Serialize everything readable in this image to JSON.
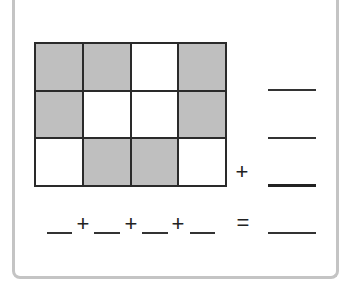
{
  "grid": {
    "rows": 3,
    "cols": 4,
    "cells": [
      [
        "shaded",
        "shaded",
        "unshaded",
        "shaded"
      ],
      [
        "shaded",
        "unshaded",
        "unshaded",
        "shaded"
      ],
      [
        "unshaded",
        "shaded",
        "shaded",
        "unshaded"
      ]
    ],
    "shaded_color": "#bfbfbf"
  },
  "row_sum_blanks": [
    "",
    "",
    ""
  ],
  "row_sum_operator": "+",
  "column_sum": {
    "blanks": [
      "",
      "",
      "",
      ""
    ],
    "operators": [
      "+",
      "+",
      "+"
    ],
    "equals": "=",
    "total_blank": ""
  }
}
